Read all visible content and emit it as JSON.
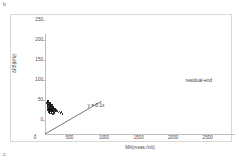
{
  "figure": {
    "panel_label_top": "b",
    "panel_label_bottom": "c"
  },
  "annotations": {
    "equation": "y = 0.1x",
    "residual": "residual-end"
  },
  "chart_data": {
    "type": "scatter",
    "title": "",
    "xlabel": "MA(meas./init)",
    "ylabel": "ΔFB(kHz)",
    "xlim": [
      0,
      2750
    ],
    "ylim": [
      0,
      250
    ],
    "xticks": [
      0,
      500,
      1000,
      1500,
      2000,
      2500
    ],
    "yticks": [
      0,
      50,
      100,
      150,
      200,
      250
    ],
    "xtick_labels": [
      "0",
      "500",
      "1000",
      "1500",
      "2000",
      "2500"
    ],
    "ytick_labels": [
      "0",
      "50",
      "100",
      "150",
      "200",
      "250"
    ],
    "grid": false,
    "legend": false,
    "series": [
      {
        "name": "residual-end",
        "marker": "circle",
        "color": "#111111",
        "points": [
          [
            30,
            78
          ],
          [
            35,
            74
          ],
          [
            38,
            70
          ],
          [
            40,
            80
          ],
          [
            42,
            66
          ],
          [
            45,
            72
          ],
          [
            48,
            62
          ],
          [
            50,
            76
          ],
          [
            52,
            68
          ],
          [
            55,
            60
          ],
          [
            58,
            74
          ],
          [
            60,
            64
          ],
          [
            62,
            70
          ],
          [
            65,
            58
          ],
          [
            68,
            72
          ],
          [
            70,
            66
          ],
          [
            72,
            62
          ],
          [
            75,
            76
          ],
          [
            78,
            56
          ],
          [
            80,
            68
          ],
          [
            82,
            72
          ],
          [
            85,
            60
          ],
          [
            88,
            64
          ],
          [
            90,
            70
          ],
          [
            92,
            54
          ],
          [
            95,
            66
          ],
          [
            98,
            62
          ],
          [
            100,
            74
          ],
          [
            102,
            58
          ],
          [
            105,
            68
          ],
          [
            108,
            64
          ],
          [
            110,
            60
          ],
          [
            112,
            70
          ],
          [
            115,
            56
          ],
          [
            118,
            66
          ],
          [
            120,
            62
          ],
          [
            125,
            58
          ],
          [
            130,
            64
          ],
          [
            135,
            60
          ],
          [
            140,
            55
          ],
          [
            145,
            62
          ],
          [
            150,
            57
          ],
          [
            160,
            60
          ],
          [
            170,
            56
          ],
          [
            180,
            58
          ],
          [
            195,
            54
          ],
          [
            210,
            56
          ],
          [
            225,
            52
          ],
          [
            240,
            55
          ],
          [
            255,
            50
          ],
          [
            33,
            82
          ],
          [
            36,
            63
          ],
          [
            44,
            84
          ],
          [
            47,
            59
          ],
          [
            53,
            81
          ],
          [
            57,
            55
          ],
          [
            63,
            79
          ],
          [
            67,
            53
          ],
          [
            73,
            77
          ],
          [
            77,
            51
          ],
          [
            83,
            75
          ],
          [
            87,
            57
          ],
          [
            93,
            71
          ],
          [
            97,
            53
          ],
          [
            103,
            69
          ],
          [
            107,
            51
          ],
          [
            113,
            67
          ],
          [
            117,
            49
          ],
          [
            123,
            65
          ],
          [
            128,
            53
          ]
        ]
      }
    ],
    "trendline": {
      "equation": "y = 0.1x",
      "slope": 0.1,
      "intercept": 0,
      "x_start": 0,
      "x_end": 820,
      "color": "#1a1a1a"
    }
  }
}
